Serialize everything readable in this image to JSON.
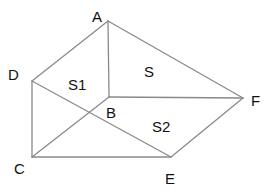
{
  "diagram": {
    "type": "geometry-figure",
    "points": {
      "A": {
        "label": "A",
        "x": 108,
        "y": 21
      },
      "B": {
        "label": "B",
        "x": 109,
        "y": 97
      },
      "C": {
        "label": "C",
        "x": 32,
        "y": 157
      },
      "D": {
        "label": "D",
        "x": 32,
        "y": 81
      },
      "E": {
        "label": "E",
        "x": 171,
        "y": 157
      },
      "F": {
        "label": "F",
        "x": 243,
        "y": 98
      }
    },
    "segments": [
      [
        "A",
        "D"
      ],
      [
        "A",
        "B"
      ],
      [
        "A",
        "F"
      ],
      [
        "D",
        "C"
      ],
      [
        "D",
        "E"
      ],
      [
        "C",
        "B"
      ],
      [
        "B",
        "F"
      ],
      [
        "C",
        "E"
      ],
      [
        "E",
        "F"
      ]
    ],
    "region_labels": {
      "s1": "S1",
      "s": "S",
      "s2": "S2"
    },
    "colors": {
      "line": "#8a8a8a",
      "text": "#111111",
      "background": "#ffffff"
    }
  }
}
